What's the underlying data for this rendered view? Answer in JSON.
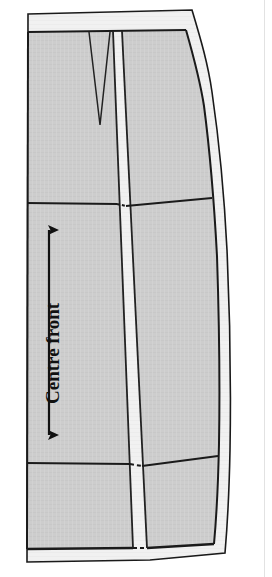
{
  "figure": {
    "kind": "sewing-pattern-diagram",
    "annotations": {
      "centre_front_label": "Centre front"
    },
    "colors": {
      "paper": "#ffffff",
      "fabric_fill": "#cdcdcd",
      "seam_allowance_fill": "#f2f2f2",
      "outline": "#1a1a1a",
      "seam_line": "#222222",
      "text": "#111111"
    },
    "geometry": {
      "outer_cut_line": "M28,14 L192,10 L210,86 L224,212 L230,330 L231,448 L226,553 L150,560 L27,562 Z",
      "stitch_line": "M28,33 L185,30 L202,96 L215,214 L221,332 L222,448 L218,542 L150,549 L27,549 Z",
      "dart": {
        "left_x": 89,
        "right_x": 110,
        "top_y": 32,
        "apex_x": 100,
        "apex_y": 125
      },
      "centre_front_band": {
        "top_left": 113,
        "top_right": 122,
        "bottom_left": 133,
        "bottom_right": 147
      },
      "horizontal_seam_upper_y": 203,
      "horizontal_seam_lower_y": 463,
      "grainline_arrow": {
        "x": 49,
        "top_y": 224,
        "bottom_y": 441
      },
      "page_edge_x": 264
    }
  }
}
